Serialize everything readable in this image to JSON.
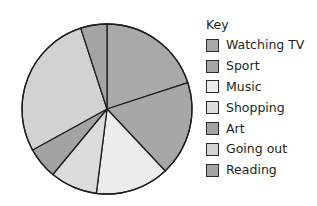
{
  "chart_data": {
    "type": "pie",
    "title": "",
    "legend_title": "Key",
    "legend_position": "right",
    "start_angle_deg": 0,
    "direction": "clockwise",
    "categories": [
      "Watching TV",
      "Sport",
      "Music",
      "Shopping",
      "Art",
      "Going out",
      "Reading"
    ],
    "values": [
      20,
      18,
      14,
      9,
      6,
      28,
      5
    ],
    "unit": "%",
    "colors": [
      "#a9a9a9",
      "#a7a7a7",
      "#ececec",
      "#dcdcdc",
      "#a3a3a3",
      "#d2d2d2",
      "#a5a5a5"
    ],
    "edge_color": "#1e1e1e"
  },
  "legend": {
    "title": "Key",
    "items": [
      {
        "label": "Watching TV",
        "color": "#a9a9a9"
      },
      {
        "label": "Sport",
        "color": "#a7a7a7"
      },
      {
        "label": "Music",
        "color": "#ececec"
      },
      {
        "label": "Shopping",
        "color": "#dcdcdc"
      },
      {
        "label": "Art",
        "color": "#a3a3a3"
      },
      {
        "label": "Going out",
        "color": "#d2d2d2"
      },
      {
        "label": "Reading",
        "color": "#a5a5a5"
      }
    ]
  }
}
